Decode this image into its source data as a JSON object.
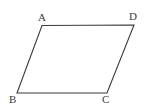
{
  "figure": {
    "kind": "geometry-diagram",
    "shape_name": "parallelogram",
    "background_color": "#ffffff",
    "stroke_color": "#3a3a3a",
    "stroke_width": 1.1,
    "label_color": "#3a3a3a",
    "canvas": {
      "width": 153,
      "height": 112
    },
    "vertices": [
      {
        "id": "A",
        "label": "A",
        "x": 42,
        "y": 25.5,
        "label_x": 38,
        "label_y": 12
      },
      {
        "id": "D",
        "label": "D",
        "x": 134,
        "y": 25,
        "label_x": 129,
        "label_y": 11
      },
      {
        "id": "C",
        "label": "C",
        "x": 107,
        "y": 93,
        "label_x": 102,
        "label_y": 94
      },
      {
        "id": "B",
        "label": "B",
        "x": 17,
        "y": 93,
        "label_x": 9,
        "label_y": 94
      }
    ],
    "edges": [
      {
        "id": "AD",
        "from": "A",
        "to": "D",
        "name": "top-edge"
      },
      {
        "id": "DC",
        "from": "D",
        "to": "C",
        "name": "right-edge"
      },
      {
        "id": "CB",
        "from": "C",
        "to": "B",
        "name": "bottom-edge"
      },
      {
        "id": "BA",
        "from": "B",
        "to": "A",
        "name": "left-edge"
      }
    ],
    "path_d": "M 42 25.5 L 134 25 L 107 93 L 17 93 Z",
    "labels": {
      "A": "A",
      "B": "B",
      "C": "C",
      "D": "D"
    }
  }
}
